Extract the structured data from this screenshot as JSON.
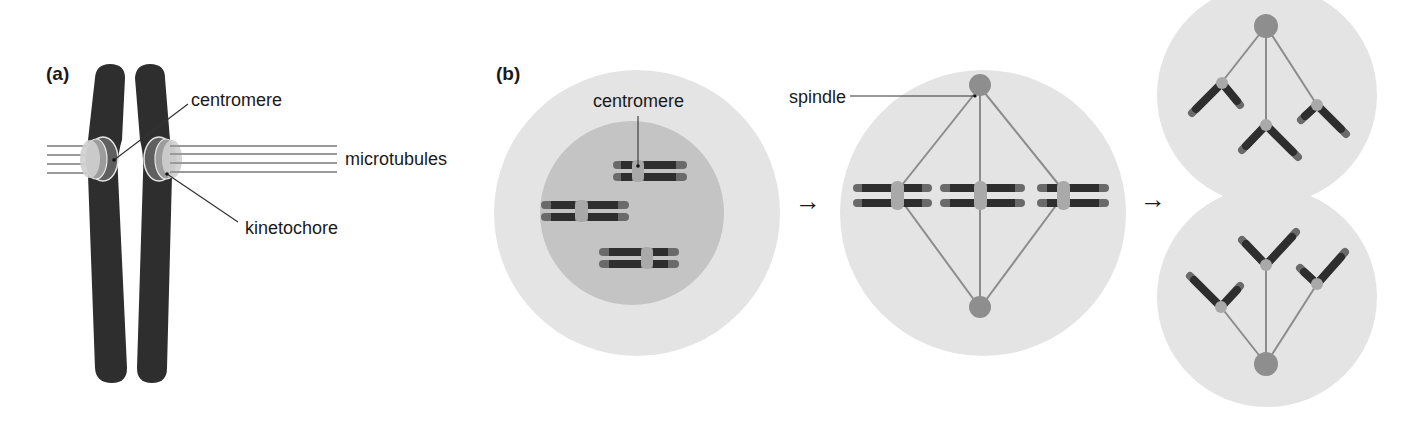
{
  "figure": {
    "panel_a": {
      "label": "(a)",
      "callouts": {
        "centromere": "centromere",
        "microtubules": "microtubules",
        "kinetochore": "kinetochore"
      }
    },
    "panel_b": {
      "label": "(b)",
      "callouts": {
        "centromere": "centromere",
        "spindle": "spindle"
      },
      "arrows": [
        "→",
        "→"
      ],
      "stages": [
        {
          "name": "prophase-cell",
          "chromosome_count": 3
        },
        {
          "name": "metaphase-cell",
          "chromosome_count": 3
        },
        {
          "name": "anaphase-daughter-cells",
          "chromosome_count": 6
        }
      ]
    },
    "colors": {
      "chromosome_dark": "#2e2e2e",
      "chromatid_tip": "#6a6a6a",
      "centromere_light": "#a9a9a9",
      "cell_outer": "#e4e4e4",
      "nucleus": "#c4c4c4",
      "spindle_line": "#8c8c8c",
      "spindle_pole": "#8e8e8e",
      "microtubule": "#9a9a9a",
      "text": "#1a1a1a"
    }
  }
}
